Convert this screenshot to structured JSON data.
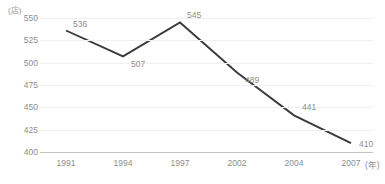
{
  "chart_data": {
    "type": "line",
    "title": "",
    "subtitle": "",
    "xlabel": "年",
    "ylabel": "店",
    "yunit_label": "(店)",
    "xunit_label": "(年)",
    "categories": [
      "1991",
      "1994",
      "1997",
      "2002",
      "2004",
      "2007"
    ],
    "x": [
      1991,
      1994,
      1997,
      2002,
      2004,
      2007
    ],
    "values": [
      536,
      507,
      545,
      489,
      441,
      410
    ],
    "point_labels": [
      "536",
      "507",
      "545",
      "489",
      "441",
      "410"
    ],
    "ylim": [
      400,
      550
    ],
    "yticks": [
      550,
      525,
      500,
      475,
      450,
      425,
      400
    ],
    "ytick_labels": [
      "550",
      "525",
      "500",
      "475",
      "450",
      "425",
      "400"
    ],
    "grid": true,
    "legend": false,
    "legend_position": "none",
    "series": [
      {
        "name": "店舗数",
        "values": [
          536,
          507,
          545,
          489,
          441,
          410
        ],
        "color": "#3a3a3a"
      }
    ],
    "colors": {
      "line": "#3a3a3a",
      "gridline": "#efefef",
      "axis": "#c4c4c4",
      "tick_text": "#8d8d8d",
      "label_text": "#8d8d8d",
      "background": "#ffffff"
    }
  },
  "footnote": {
    "text": ""
  }
}
